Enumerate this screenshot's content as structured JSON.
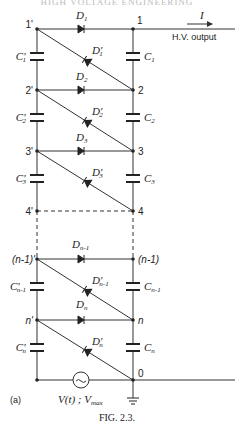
{
  "header": {
    "text": "HIGH VOLTAGE ENGINEERING"
  },
  "figure": {
    "caption": "FIG. 2.3.",
    "panel_label": "(a)",
    "output": {
      "current_label": "I",
      "output_label": "H.V. output"
    },
    "source": {
      "label_main": "V(t) ; V",
      "label_sub": "max",
      "symbol": "~"
    },
    "ground_node": "0",
    "stages": [
      {
        "left_node": "1'",
        "right_node": "1",
        "diode_fwd": "D",
        "diode_fwd_sub": "1",
        "diode_diag": "D'",
        "diode_diag_sub": "1",
        "cap_left": "C'",
        "cap_left_sub": "1",
        "cap_right": "C",
        "cap_right_sub": "1"
      },
      {
        "left_node": "2'",
        "right_node": "2",
        "diode_fwd": "D",
        "diode_fwd_sub": "2",
        "diode_diag": "D'",
        "diode_diag_sub": "2",
        "cap_left": "C'",
        "cap_left_sub": "2",
        "cap_right": "C",
        "cap_right_sub": "2"
      },
      {
        "left_node": "3'",
        "right_node": "3",
        "diode_fwd": "D",
        "diode_fwd_sub": "3",
        "diode_diag": "D'",
        "diode_diag_sub": "3",
        "cap_left": "C'",
        "cap_left_sub": "3",
        "cap_right": "C",
        "cap_right_sub": "3"
      },
      {
        "left_node": "4'",
        "right_node": "4"
      },
      {
        "left_node": "(n-1)'",
        "right_node": "(n-1)",
        "diode_fwd": "D",
        "diode_fwd_sub": "n-1",
        "diode_diag": "D'",
        "diode_diag_sub": "n-1",
        "cap_left": "C'",
        "cap_left_sub": "n-1",
        "cap_right": "C",
        "cap_right_sub": "n-1"
      },
      {
        "left_node": "n'",
        "right_node": "n",
        "diode_fwd": "D",
        "diode_fwd_sub": "n",
        "diode_diag": "D'",
        "diode_diag_sub": "n",
        "cap_left": "C'",
        "cap_left_sub": "n",
        "cap_right": "C",
        "cap_right_sub": "n"
      }
    ]
  }
}
